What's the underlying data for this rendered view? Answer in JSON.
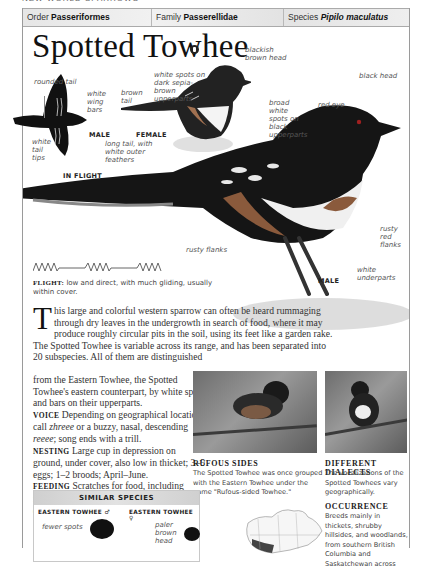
{
  "running_head": "NEW WORLD SPARROWS",
  "header": {
    "order_label": "Order",
    "order_value": "Passeriformes",
    "family_label": "Family",
    "family_value": "Passerellidae",
    "species_label": "Species",
    "species_value": "Pipilo maculatus"
  },
  "title": "Spotted Towhee",
  "sound_icon": "speaker-icon",
  "illustration": {
    "flight": {
      "caption": "IN FLIGHT",
      "sex": "MALE",
      "labels": {
        "rounded_tail": "rounded tail",
        "white_wing_bars": "white wing bars",
        "white_tail_tips": "white tail tips"
      }
    },
    "female": {
      "sex": "FEMALE",
      "labels": {
        "brown_tail": "brown tail",
        "white_spots": "white spots on dark sepia-brown upperparts",
        "head": "blackish brown head"
      }
    },
    "male": {
      "sex": "MALE",
      "labels": {
        "black_head": "black head",
        "red_eye": "red eye",
        "broad_spots": "broad white spots on black upperparts",
        "long_tail": "long tail, with white outer feathers",
        "rusty_flanks_left": "rusty flanks",
        "rusty_red_flanks": "rusty red flanks",
        "white_underparts": "white underparts"
      }
    }
  },
  "flight": {
    "label": "FLIGHT:",
    "text": "low and direct, with much gliding, usually within cover."
  },
  "intro": {
    "dropcap": "T",
    "text_a": "his large and colorful western sparrow can often be heard rummaging through dry leaves in the undergrowth in search of food, where it may produce roughly circular pits in the soil, using its feet like a garden rake. The Spotted Towhee is variable across its range, and has been separated into 20 subspecies. All of them are distinguished",
    "text_b": "from the Eastern Towhee, the Spotted Towhee's eastern counterpart, by white spots and bars on their upperparts."
  },
  "sections": {
    "voice": {
      "head": "VOICE",
      "text_pre": "Depending on geographical location, call ",
      "call": "zhreee",
      "text_mid": " or a buzzy, nasal, descending ",
      "call2": "reeee",
      "text_post": "; song ends with a trill."
    },
    "nesting": {
      "head": "NESTING",
      "text": "Large cup in depression on ground, under cover, also low in thicket; 3–5 eggs; 1–2 broods; April–June."
    },
    "feeding": {
      "head": "FEEDING",
      "text": "Scratches for food, including insects, fruit, seeds, and acorns; sometimes eats small snakes and lizards."
    }
  },
  "photos": {
    "rufous": {
      "title": "RUFOUS SIDES",
      "text": "The Spotted Towhee was once grouped with the Eastern Towhee under the name \"Rufous-sided Towhee.\""
    },
    "dialects": {
      "title": "DIFFERENT DIALECTS",
      "text": "The vocalizations of the Spotted Towhees vary geographically."
    }
  },
  "occurrence": {
    "title": "OCCURRENCE",
    "text": "Breeds mainly in thickets, shrubby hillsides, and woodlands, from southern British Columbia and Saskatchewan across"
  },
  "similar_species": {
    "title": "SIMILAR SPECIES",
    "items": [
      {
        "name": "EASTERN TOWHEE",
        "sex_symbol": "♂",
        "label": "fewer spots"
      },
      {
        "name": "EASTERN TOWHEE",
        "sex_symbol": "♀",
        "label": "paler brown head"
      }
    ]
  },
  "colors": {
    "header_bg": "#e8e8e8",
    "border": "#9a9a9a",
    "text": "#333333"
  }
}
